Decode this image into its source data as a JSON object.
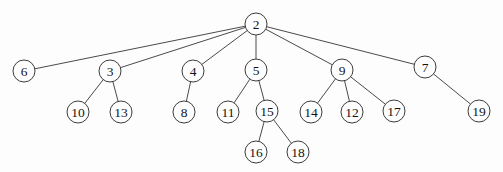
{
  "diagram": {
    "type": "tree",
    "root": "2",
    "colors": {
      "background": "#fdfdfd",
      "node_fill": "#fefefe",
      "node_stroke": "#3c3c3c",
      "edge": "#4a4a4a",
      "text": "#141414"
    },
    "node_radius": 11,
    "nodes": [
      {
        "id": "2",
        "label": "2",
        "x": 256,
        "y": 24
      },
      {
        "id": "6",
        "label": "6",
        "x": 24,
        "y": 71
      },
      {
        "id": "3",
        "label": "3",
        "x": 110,
        "y": 71
      },
      {
        "id": "4",
        "label": "4",
        "x": 193,
        "y": 71
      },
      {
        "id": "5",
        "label": "5",
        "x": 256,
        "y": 70
      },
      {
        "id": "9",
        "label": "9",
        "x": 342,
        "y": 70
      },
      {
        "id": "7",
        "label": "7",
        "x": 425,
        "y": 67
      },
      {
        "id": "10",
        "label": "10",
        "x": 78,
        "y": 112
      },
      {
        "id": "13",
        "label": "13",
        "x": 121,
        "y": 112
      },
      {
        "id": "8",
        "label": "8",
        "x": 184,
        "y": 112
      },
      {
        "id": "11",
        "label": "11",
        "x": 228,
        "y": 112
      },
      {
        "id": "15",
        "label": "15",
        "x": 267,
        "y": 111
      },
      {
        "id": "14",
        "label": "14",
        "x": 311,
        "y": 112
      },
      {
        "id": "12",
        "label": "12",
        "x": 352,
        "y": 112
      },
      {
        "id": "17",
        "label": "17",
        "x": 394,
        "y": 111
      },
      {
        "id": "19",
        "label": "19",
        "x": 479,
        "y": 111
      },
      {
        "id": "16",
        "label": "16",
        "x": 256,
        "y": 152
      },
      {
        "id": "18",
        "label": "18",
        "x": 298,
        "y": 152
      }
    ],
    "edges": [
      [
        "2",
        "6"
      ],
      [
        "2",
        "3"
      ],
      [
        "2",
        "4"
      ],
      [
        "2",
        "5"
      ],
      [
        "2",
        "9"
      ],
      [
        "2",
        "7"
      ],
      [
        "3",
        "10"
      ],
      [
        "3",
        "13"
      ],
      [
        "4",
        "8"
      ],
      [
        "5",
        "11"
      ],
      [
        "5",
        "15"
      ],
      [
        "9",
        "14"
      ],
      [
        "9",
        "12"
      ],
      [
        "9",
        "17"
      ],
      [
        "7",
        "19"
      ],
      [
        "15",
        "16"
      ],
      [
        "15",
        "18"
      ]
    ]
  }
}
